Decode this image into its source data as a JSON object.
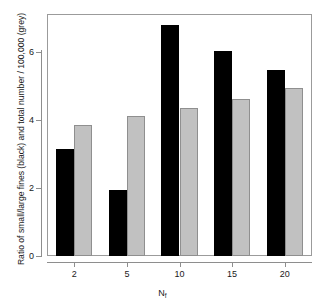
{
  "chart_data": {
    "type": "bar",
    "title": "",
    "subtitle": "",
    "xlabel": "N_f",
    "xlabel_base": "N",
    "xlabel_sub": "f",
    "ylabel": "Ratio of small/large fines (black) and total number / 100,000 (grey)",
    "categories": [
      "2",
      "5",
      "10",
      "15",
      "20"
    ],
    "series": [
      {
        "name": "Ratio of small/large fines (black)",
        "color": "#000000",
        "values": [
          3.15,
          1.95,
          6.8,
          6.05,
          5.48
        ]
      },
      {
        "name": "Total number / 100,000 (grey)",
        "color": "#c1c1c1",
        "values": [
          3.85,
          4.12,
          4.35,
          4.62,
          4.95
        ]
      }
    ],
    "ylim": [
      0,
      7.1
    ],
    "yticks": [
      0,
      2,
      4,
      6
    ],
    "ytick_labels": [
      "0",
      "2",
      "4",
      "6"
    ],
    "grid": false,
    "legend": "none",
    "frame": true
  },
  "axis": {
    "y_title": "Ratio of small/large fines (black) and total number / 100,000 (grey)",
    "x_title_base": "N",
    "x_title_sub": "f"
  }
}
